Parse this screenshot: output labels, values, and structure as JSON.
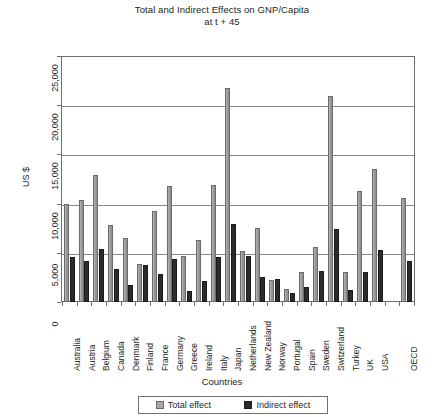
{
  "chart_data": {
    "type": "bar",
    "title": "Total and Indirect Effects on GNP/Capita",
    "subtitle": "at t + 45",
    "xlabel": "Countries",
    "ylabel": "US $",
    "ylim": [
      0,
      25000
    ],
    "yticks": [
      0,
      5000,
      10000,
      15000,
      20000,
      25000
    ],
    "ytick_labels": [
      "0",
      "5,000",
      "10,000",
      "15,000",
      "20,000",
      "25,000"
    ],
    "grid": true,
    "legend_position": "bottom",
    "categories": [
      "Australia",
      "Austria",
      "Belgium",
      "Canada",
      "Denmark",
      "Finland",
      "France",
      "Germany",
      "Greece",
      "Ireland",
      "Italy",
      "Japan",
      "Netherlands",
      "New Zealand",
      "Norway",
      "Portugal",
      "Spain",
      "Sweden",
      "Switzerland",
      "Turkey",
      "UK",
      "USA",
      "",
      "OECD"
    ],
    "series": [
      {
        "name": "Total effect",
        "color": "#9d9d9d",
        "values": [
          10000,
          10400,
          12900,
          7800,
          6500,
          3900,
          9200,
          11800,
          4700,
          6300,
          11900,
          21700,
          5200,
          7500,
          2200,
          1300,
          3000,
          5600,
          20900,
          3000,
          11300,
          13500,
          null,
          10600
        ]
      },
      {
        "name": "Indirect effect",
        "color": "#2b2b2b",
        "values": [
          4600,
          4200,
          5400,
          3400,
          1700,
          3800,
          2800,
          4400,
          1100,
          2100,
          4600,
          7900,
          4700,
          2500,
          2300,
          900,
          1500,
          3200,
          7400,
          1200,
          3000,
          5300,
          null,
          4200
        ]
      }
    ]
  },
  "legend": {
    "items": [
      {
        "label": "Total effect",
        "swatch": "total"
      },
      {
        "label": "Indirect effect",
        "swatch": "indirect"
      }
    ]
  }
}
